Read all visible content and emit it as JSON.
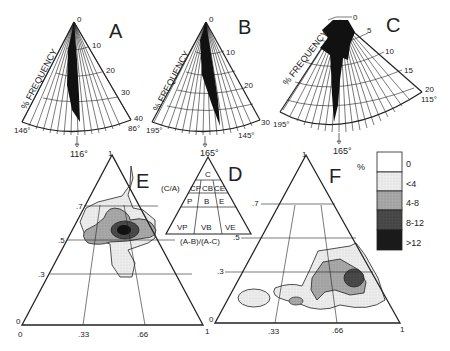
{
  "figure": {
    "panels": {
      "A": {
        "label": "A",
        "axis_title": "% FREQUENCY",
        "radial_ticks": [
          "0",
          "10",
          "20",
          "30",
          "40"
        ],
        "left_angle": "146°",
        "right_angle": "86°",
        "mean_direction": "116°"
      },
      "B": {
        "label": "B",
        "axis_title": "% FREQUENCY",
        "radial_ticks": [
          "0",
          "10",
          "20",
          "30"
        ],
        "left_angle": "195°",
        "right_angle": "145°",
        "mean_direction": "165°"
      },
      "C": {
        "label": "C",
        "axis_title": "% FREQUENCY",
        "radial_ticks": [
          "0",
          "5",
          "10",
          "15",
          "20"
        ],
        "left_angle": "195°",
        "right_angle": "115°",
        "mean_direction": "165°"
      },
      "D": {
        "label": "D",
        "left_label": "(C/A)",
        "bottom_label": "(A-B)/(A-C)",
        "right_tick": ".5",
        "cells": [
          "C",
          "CP",
          "CB",
          "CE",
          "P",
          "B",
          "E",
          "VP",
          "VB",
          "VE"
        ]
      },
      "E": {
        "label": "E",
        "apex": "1",
        "y_ticks": [
          ".7",
          ".5",
          ".3",
          "0"
        ],
        "x_ticks": [
          "0",
          ".33",
          ".66",
          "1"
        ]
      },
      "F": {
        "label": "F",
        "apex": "1",
        "y_ticks": [
          ".7",
          ".5",
          ".3",
          "0"
        ],
        "x_ticks": [
          "0",
          ".33",
          ".66",
          "1"
        ]
      }
    },
    "legend": {
      "title": "%",
      "items": [
        {
          "label": "0",
          "color": "#ffffff"
        },
        {
          "label": "<4",
          "color": "#e8e8e8"
        },
        {
          "label": "4-8",
          "color": "#a9a9a9"
        },
        {
          "label": "8-12",
          "color": "#4a4a4a"
        },
        {
          "label": ">12",
          "color": "#1a1a1a"
        }
      ]
    }
  }
}
